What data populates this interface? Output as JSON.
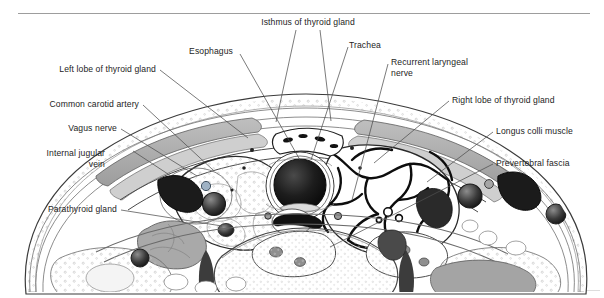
{
  "figure": {
    "title_rule": "horizontal-rule",
    "kind": "anatomical-cross-section",
    "region": "neck at level of thyroid gland (axial section)",
    "colors": {
      "ink": "#1a1a1a",
      "rule": "#9a9a9a",
      "line": "#555555",
      "muscle_fill": "#a8a8a8",
      "muscle_fill_light": "#c9c9c9",
      "fat_fill": "#f2f2f2",
      "lumen_dark": "#141414",
      "vessel_fill": "#6e6e6e",
      "bone_fill": "#fbfbfb",
      "page": "#ffffff"
    },
    "labels": [
      {
        "id": "isthmus-of-thyroid-gland",
        "text": "Isthmus of thyroid gland",
        "align": "center",
        "x": 308,
        "y": 22
      },
      {
        "id": "esophagus",
        "text": "Esophagus",
        "align": "right",
        "x": 233,
        "y": 51
      },
      {
        "id": "trachea",
        "text": "Trachea",
        "align": "left",
        "x": 349,
        "y": 45
      },
      {
        "id": "recurrent-laryngeal-nerve",
        "text": "Recurrent laryngeal\nnerve",
        "align": "left",
        "x": 391,
        "y": 62
      },
      {
        "id": "left-lobe-of-thyroid-gland",
        "text": "Left lobe of thyroid gland",
        "align": "right",
        "x": 156,
        "y": 69
      },
      {
        "id": "common-carotid-artery",
        "text": "Common carotid artery",
        "align": "right",
        "x": 139,
        "y": 104
      },
      {
        "id": "right-lobe-of-thyroid-gland",
        "text": "Right lobe of thyroid gland",
        "align": "left",
        "x": 452,
        "y": 100
      },
      {
        "id": "vagus-nerve",
        "text": "Vagus nerve",
        "align": "right",
        "x": 117,
        "y": 128
      },
      {
        "id": "longus-colli-muscle",
        "text": "Longus colli muscle",
        "align": "left",
        "x": 496,
        "y": 131
      },
      {
        "id": "internal-jugular-vein",
        "text": "Internal jugular\nvein",
        "align": "right",
        "x": 105,
        "y": 153
      },
      {
        "id": "prevertebral-fascia",
        "text": "Prevertebral fascia",
        "align": "left",
        "x": 496,
        "y": 163
      },
      {
        "id": "parathyroid-gland",
        "text": "Parathyroid gland",
        "align": "right",
        "x": 117,
        "y": 209
      }
    ],
    "leaders": [
      {
        "id": "leader-isthmus-left",
        "from": [
          296,
          30
        ],
        "to": [
          276,
          122
        ]
      },
      {
        "id": "leader-isthmus-right",
        "from": [
          320,
          30
        ],
        "to": [
          331,
          121
        ]
      },
      {
        "id": "leader-esophagus",
        "from": [
          240,
          54
        ],
        "to": [
          300,
          160
        ]
      },
      {
        "id": "leader-trachea",
        "from": [
          348,
          47
        ],
        "to": [
          311,
          160
        ]
      },
      {
        "id": "leader-recurrent",
        "from": [
          388,
          64
        ],
        "to": [
          352,
          200
        ]
      },
      {
        "id": "leader-left-lobe",
        "from": [
          160,
          70
        ],
        "to": [
          248,
          138
        ]
      },
      {
        "id": "leader-common-carotid",
        "from": [
          143,
          105
        ],
        "to": [
          213,
          170
        ]
      },
      {
        "id": "leader-right-lobe",
        "from": [
          449,
          101
        ],
        "to": [
          374,
          163
        ]
      },
      {
        "id": "leader-vagus",
        "from": [
          121,
          129
        ],
        "to": [
          197,
          176
        ]
      },
      {
        "id": "leader-longus",
        "from": [
          493,
          132
        ],
        "to": [
          427,
          182
        ]
      },
      {
        "id": "leader-internal-jugular",
        "from": [
          133,
          151
        ],
        "to": [
          171,
          176
        ]
      },
      {
        "id": "leader-prevertebral",
        "from": [
          493,
          164
        ],
        "to": [
          330,
          247
        ]
      },
      {
        "id": "leader-parathyroid",
        "from": [
          121,
          210
        ],
        "to": [
          222,
          226
        ]
      }
    ]
  }
}
